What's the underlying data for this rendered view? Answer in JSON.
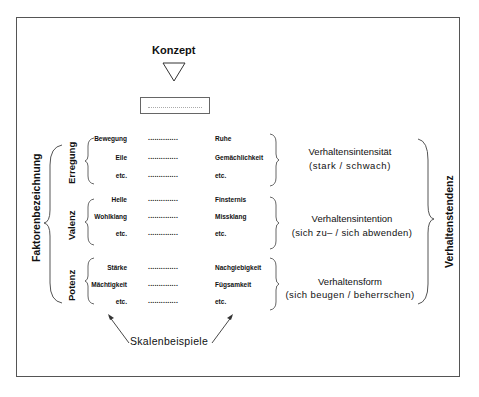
{
  "diagram": {
    "concept_label": "Konzept",
    "left_axis_label": "Faktorenbezeichnung",
    "right_axis_label": "Verhaltenstendenz",
    "bottom_label": "Skalenbeispiele",
    "dots": "..............",
    "factors": [
      {
        "name": "Erregung",
        "rows": [
          {
            "left": "Bewegung",
            "right": "Ruhe"
          },
          {
            "left": "Eile",
            "right": "Gemächlichkeit"
          },
          {
            "left": "etc.",
            "right": "etc."
          }
        ],
        "title": "Verhaltensintensität",
        "subtitle": "(stark / schwach)"
      },
      {
        "name": "Valenz",
        "rows": [
          {
            "left": "Helle",
            "right": "Finsternis"
          },
          {
            "left": "Wohlklang",
            "right": "Missklang"
          },
          {
            "left": "etc.",
            "right": "etc."
          }
        ],
        "title": "Verhaltensintention",
        "subtitle": "(sich zu– / sich abwenden)"
      },
      {
        "name": "Potenz",
        "rows": [
          {
            "left": "Stärke",
            "right": "Nachgiebigkeit"
          },
          {
            "left": "Mächtigkeit",
            "right": "Fügsamkeit"
          },
          {
            "left": "etc.",
            "right": "etc."
          }
        ],
        "title": "Verhaltensform",
        "subtitle": "(sich beugen / beherrschen)"
      }
    ]
  }
}
